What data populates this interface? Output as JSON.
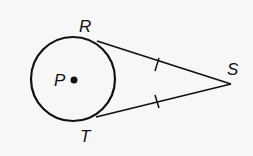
{
  "diagram": {
    "type": "geometry",
    "circle": {
      "center_label": "P",
      "cx": 73,
      "cy": 79,
      "r": 42
    },
    "points": [
      {
        "label": "R",
        "x": 97,
        "y": 41,
        "label_x": 79,
        "label_y": 32
      },
      {
        "label": "T",
        "x": 96,
        "y": 117,
        "label_x": 80,
        "label_y": 142
      },
      {
        "label": "S",
        "x": 231,
        "y": 84,
        "label_x": 227,
        "label_y": 75
      },
      {
        "label": "P",
        "x": 74,
        "y": 80,
        "label_x": 54,
        "label_y": 86
      }
    ],
    "segments": [
      {
        "from": "R",
        "to": "S",
        "tick_marks": 1
      },
      {
        "from": "T",
        "to": "S",
        "tick_marks": 1
      }
    ],
    "colors": {
      "stroke": "#111111",
      "background": "#f7f7f7"
    }
  }
}
